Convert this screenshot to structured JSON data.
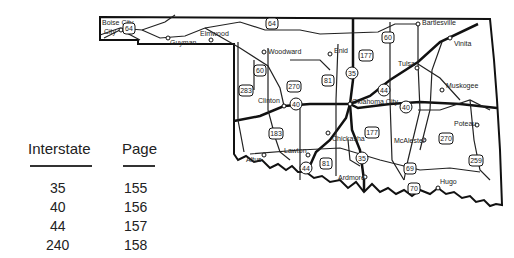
{
  "index_table": {
    "headers": {
      "interstate": "Interstate",
      "page": "Page"
    },
    "rows": [
      {
        "interstate": "35",
        "page": "155"
      },
      {
        "interstate": "40",
        "page": "156"
      },
      {
        "interstate": "44",
        "page": "157"
      },
      {
        "interstate": "240",
        "page": "158"
      }
    ]
  },
  "map": {
    "cities": [
      {
        "name": "Boise City"
      },
      {
        "name": "Guyman"
      },
      {
        "name": "Elmwood"
      },
      {
        "name": "Woodward"
      },
      {
        "name": "Enid"
      },
      {
        "name": "Bartlesville"
      },
      {
        "name": "Vinita"
      },
      {
        "name": "Tulsa"
      },
      {
        "name": "Muskogee"
      },
      {
        "name": "Clinton"
      },
      {
        "name": "Oklahoma City"
      },
      {
        "name": "Poteau"
      },
      {
        "name": "McAlester"
      },
      {
        "name": "Chickasha"
      },
      {
        "name": "Lawton"
      },
      {
        "name": "Altus"
      },
      {
        "name": "Ardmore"
      },
      {
        "name": "Hugo"
      }
    ],
    "shields": [
      "64",
      "64",
      "60",
      "60",
      "270",
      "283",
      "81",
      "35",
      "177",
      "44",
      "40",
      "40",
      "183",
      "81",
      "44",
      "35",
      "177",
      "69",
      "70",
      "270",
      "259"
    ]
  }
}
